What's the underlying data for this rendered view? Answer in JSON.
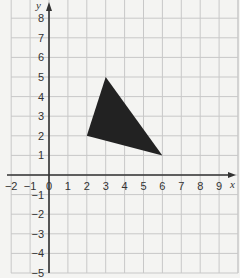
{
  "chart_data": {
    "type": "scatter",
    "title": "",
    "xlabel": "x",
    "ylabel": "y",
    "xlim": [
      -2,
      10
    ],
    "ylim": [
      -5,
      9
    ],
    "grid": true,
    "x_ticks": [
      "-2",
      "-1",
      "0",
      "1",
      "2",
      "3",
      "4",
      "5",
      "6",
      "7",
      "8",
      "9"
    ],
    "y_ticks": [
      "8",
      "7",
      "6",
      "5",
      "4",
      "3",
      "2",
      "1",
      "-1",
      "-2",
      "-3",
      "-4",
      "-5"
    ],
    "shapes": [
      {
        "name": "triangle",
        "fill": "#222222",
        "vertices": [
          [
            2,
            2
          ],
          [
            3,
            5
          ],
          [
            6,
            1
          ]
        ]
      }
    ]
  },
  "colors": {
    "background": "#f4f4f2",
    "grid": "#c8c8c8",
    "axis": "#333333",
    "shape": "#222222"
  }
}
